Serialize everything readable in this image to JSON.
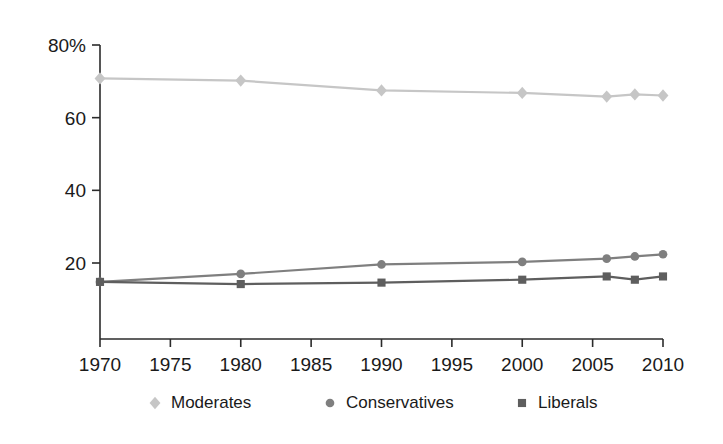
{
  "chart_data": {
    "type": "line",
    "title": "",
    "subtitle": "",
    "xlabel": "",
    "ylabel": "",
    "x": [
      1970,
      1980,
      1990,
      2000,
      2006,
      2008,
      2010
    ],
    "xlim": [
      1970,
      2010
    ],
    "ylim": [
      0,
      80
    ],
    "xtick_labels": [
      "1970",
      "1975",
      "1980",
      "1985",
      "1990",
      "1995",
      "2000",
      "2005",
      "2010"
    ],
    "xticks": [
      1970,
      1975,
      1980,
      1985,
      1990,
      1995,
      2000,
      2005,
      2010
    ],
    "ytick_labels": [
      "20",
      "40",
      "60",
      "80%"
    ],
    "yticks": [
      20,
      40,
      60,
      80
    ],
    "grid": false,
    "legend_position": "bottom",
    "series": [
      {
        "name": "Moderates",
        "marker": "diamond",
        "color": "#c6c6c6",
        "values": [
          70.8,
          70.2,
          67.5,
          66.8,
          65.8,
          66.4,
          66.1
        ]
      },
      {
        "name": "Conservatives",
        "marker": "circle",
        "color": "#7f7f7f",
        "values": [
          14.8,
          17.0,
          19.6,
          20.3,
          21.2,
          21.8,
          22.4
        ]
      },
      {
        "name": "Liberals",
        "marker": "square",
        "color": "#5e5e5e",
        "values": [
          14.8,
          14.2,
          14.6,
          15.4,
          16.3,
          15.4,
          16.3
        ]
      }
    ]
  },
  "legend": {
    "items": [
      {
        "label": "Moderates",
        "marker": "diamond-marker-icon",
        "color": "#c6c6c6"
      },
      {
        "label": "Conservatives",
        "marker": "circle-marker-icon",
        "color": "#7f7f7f"
      },
      {
        "label": "Liberals",
        "marker": "square-marker-icon",
        "color": "#5e5e5e"
      }
    ]
  },
  "axes": {
    "y_axis_name": "percent-axis",
    "x_axis_name": "year-axis"
  }
}
